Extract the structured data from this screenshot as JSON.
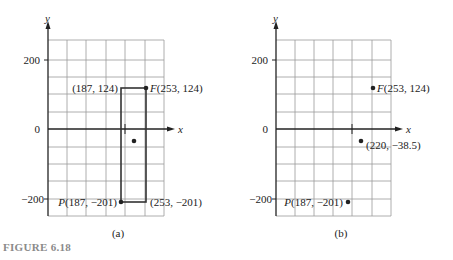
{
  "figure": {
    "caption": "FIGURE 6.18",
    "caption_color": "#8a8a8a"
  },
  "panels": [
    {
      "id": "a",
      "sublabel": "(a)",
      "axis_x_label": "x",
      "axis_y_label": "y",
      "y_ticks": [
        "200",
        "0",
        "−200"
      ],
      "points": {
        "F": {
          "label": "F(253, 124)"
        },
        "top_left": {
          "label": "(187, 124)"
        },
        "P": {
          "label": "P(187, −201)"
        },
        "bottom_right": {
          "label": "(253, −201)"
        }
      }
    },
    {
      "id": "b",
      "sublabel": "(b)",
      "axis_x_label": "x",
      "axis_y_label": "y",
      "y_ticks": [
        "200",
        "0",
        "−200"
      ],
      "points": {
        "F": {
          "label": "F(253, 124)"
        },
        "mid": {
          "label": "(220, −38.5)"
        },
        "P": {
          "label": "P(187, −201)"
        }
      }
    }
  ],
  "chart_data": [
    {
      "type": "scatter",
      "title": "(a)",
      "xlabel": "x",
      "ylabel": "y",
      "ylim": [
        -250,
        300
      ],
      "y_tick_labels": [
        "200",
        "0",
        "-200"
      ],
      "grid": true,
      "points": [
        {
          "name": "F",
          "x": 253,
          "y": 124
        },
        {
          "name": "",
          "x": 187,
          "y": 124
        },
        {
          "name": "P",
          "x": 187,
          "y": -201
        },
        {
          "name": "",
          "x": 253,
          "y": -201
        },
        {
          "name": "center",
          "x": 220,
          "y": -38.5
        }
      ],
      "shapes": [
        {
          "type": "rectangle",
          "x0": 187,
          "y0": -201,
          "x1": 253,
          "y1": 124
        }
      ]
    },
    {
      "type": "scatter",
      "title": "(b)",
      "xlabel": "x",
      "ylabel": "y",
      "ylim": [
        -250,
        300
      ],
      "y_tick_labels": [
        "200",
        "0",
        "-200"
      ],
      "grid": true,
      "points": [
        {
          "name": "F",
          "x": 253,
          "y": 124
        },
        {
          "name": "",
          "x": 220,
          "y": -38.5
        },
        {
          "name": "P",
          "x": 187,
          "y": -201
        }
      ]
    }
  ]
}
